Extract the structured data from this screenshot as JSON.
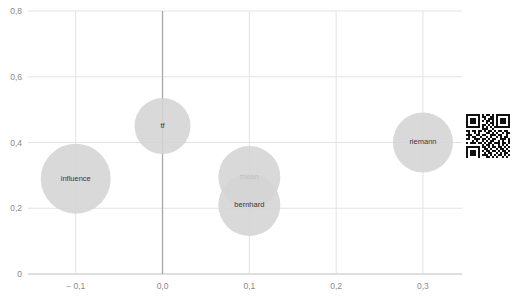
{
  "chart_data": {
    "type": "scatter",
    "title": "",
    "xlabel": "",
    "ylabel": "",
    "xlim": [
      -0.155,
      0.345
    ],
    "ylim": [
      0,
      0.8
    ],
    "grid": true,
    "legend": null,
    "decimal_separator": ",",
    "x_ticks": [
      {
        "value": -0.1,
        "label": "− 0,1"
      },
      {
        "value": 0.0,
        "label": "0,0"
      },
      {
        "value": 0.1,
        "label": "0,1"
      },
      {
        "value": 0.2,
        "label": "0,2"
      },
      {
        "value": 0.3,
        "label": "0,3"
      }
    ],
    "y_ticks": [
      {
        "value": 0.0,
        "label": "0"
      },
      {
        "value": 0.2,
        "label": "0,2"
      },
      {
        "value": 0.4,
        "label": "0,4"
      },
      {
        "value": 0.6,
        "label": "0,6"
      },
      {
        "value": 0.8,
        "label": "0,8"
      }
    ],
    "points": [
      {
        "label": "influence",
        "x": -0.1,
        "y": 0.29,
        "r": 35
      },
      {
        "label": "tf",
        "x": 0.0,
        "y": 0.45,
        "r": 28
      },
      {
        "label": "mean",
        "x": 0.1,
        "y": 0.295,
        "r": 31
      },
      {
        "label": "bernhard",
        "x": 0.1,
        "y": 0.21,
        "r": 31
      },
      {
        "label": "riemann",
        "x": 0.3,
        "y": 0.4,
        "r": 30
      }
    ],
    "colors": {
      "bubble": "#d4d4d4",
      "gridline": "#e3e3e3",
      "axis": "#bdbdbd",
      "zero_axis": "#a8a8a8",
      "tick_text": "#8a8a8a",
      "bubble_text": "#3a3a3a"
    }
  },
  "qr_code": {
    "name": "qr-code",
    "modules": [
      "1111111010110101111111",
      "1000001011001101000001",
      "1011101001011101011101",
      "1011101010110101011101",
      "1011101000101101011101",
      "1000001011010101000001",
      "1111111010101011111111",
      "0000000011100100000000",
      "1101101101011010110110",
      "0100101000110101001011",
      "1110011011001110110010",
      "0101100100101001010110",
      "1100111011010110011101",
      "0001010010101100101001",
      "1011101101011011101101",
      "0000000010110100101010",
      "1111111011010110110101",
      "1000001001101001011010",
      "1011101010110110101101",
      "1011101001011001010110",
      "1011101011101010110101",
      "1000001000110101001010",
      "1111111011011010110101"
    ]
  }
}
